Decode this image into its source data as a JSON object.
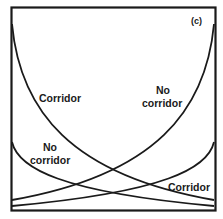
{
  "panel": {
    "label": "(c)"
  },
  "colors": {
    "line": "#1a1a1a",
    "background": "#ffffff"
  },
  "labels": {
    "corridor_upper": "Corridor",
    "no_corridor_upper_line1": "No",
    "no_corridor_upper_line2": "corridor",
    "no_corridor_lower_line1": "No",
    "no_corridor_lower_line2": "corridor",
    "corridor_lower": "Corridor"
  },
  "curves": [
    {
      "id": "corridor-large",
      "direction": "decreasing",
      "from": [
        12,
        25
      ],
      "to": [
        215,
        200
      ]
    },
    {
      "id": "no-corridor-large",
      "direction": "increasing",
      "from": [
        12,
        200
      ],
      "to": [
        215,
        25
      ]
    },
    {
      "id": "no-corridor-small",
      "direction": "decreasing",
      "from": [
        12,
        142
      ],
      "to": [
        215,
        207
      ]
    },
    {
      "id": "corridor-small",
      "direction": "increasing",
      "from": [
        12,
        207
      ],
      "to": [
        215,
        142
      ]
    }
  ]
}
